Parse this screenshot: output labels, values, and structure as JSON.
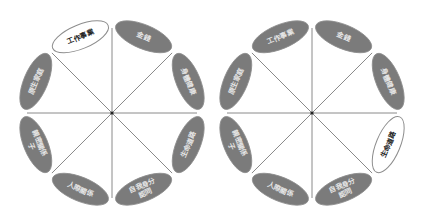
{
  "colors": {
    "segment_fill": "#7b7b7b",
    "highlight_fill": "#ffffff",
    "label_light": "#e6e6e6",
    "label_dark": "#222222",
    "spoke": "#8a8a8a"
  },
  "wheels": [
    {
      "name": "life-wheel-left",
      "highlighted": "工作事業",
      "segments": [
        {
          "label": "工作事業"
        },
        {
          "label": "金錢"
        },
        {
          "label": "身體健康"
        },
        {
          "label": "生命道路"
        },
        {
          "label": "自我身分認同"
        },
        {
          "label": "人際關係"
        },
        {
          "label": "親密關係子"
        },
        {
          "label": "原生家庭"
        }
      ]
    },
    {
      "name": "life-wheel-right",
      "highlighted": "生命道路",
      "segments": [
        {
          "label": "工作事業"
        },
        {
          "label": "金錢"
        },
        {
          "label": "身體健康"
        },
        {
          "label": "生命道路"
        },
        {
          "label": "自我身分認同"
        },
        {
          "label": "人際關係"
        },
        {
          "label": "親密關係子"
        },
        {
          "label": "原生家庭"
        }
      ]
    }
  ]
}
